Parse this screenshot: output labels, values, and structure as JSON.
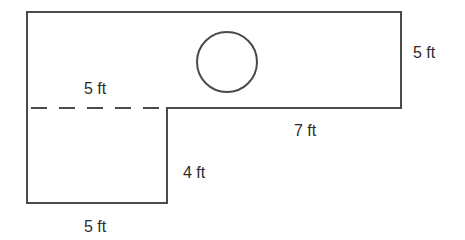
{
  "diagram": {
    "type": "composite floor plan",
    "colors": {
      "line": "#4a4a4a",
      "text": "#2b2b2b",
      "background": "#ffffff"
    },
    "shapes": {
      "upper_rectangle": {
        "x": 27,
        "y": 12,
        "width": 374,
        "height": 96
      },
      "lower_rectangle": {
        "x": 27,
        "y": 108,
        "width": 140,
        "height": 95
      },
      "circle": {
        "cx": 227,
        "cy": 62,
        "r": 30
      },
      "dashed_divider": {
        "x1": 31,
        "x2": 167,
        "y": 108
      }
    },
    "labels": {
      "dashed_top_width": "5 ft",
      "right_height": "5 ft",
      "bottom_right_width": "7 ft",
      "lower_height": "4 ft",
      "lower_width": "5 ft"
    }
  }
}
